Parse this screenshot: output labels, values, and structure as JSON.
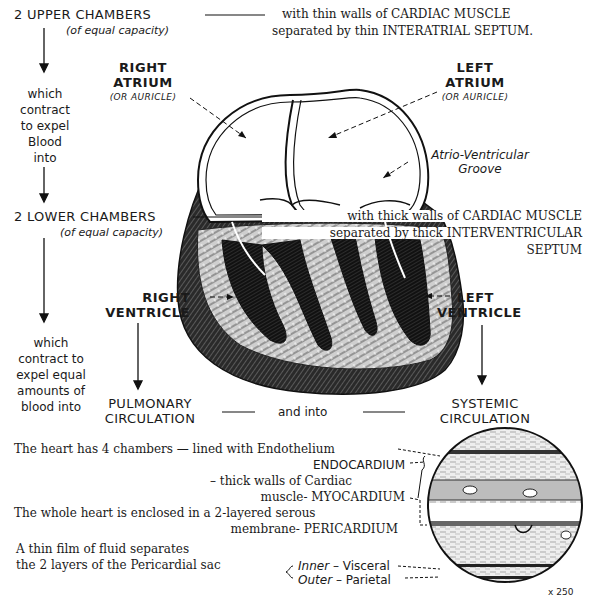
{
  "upper": {
    "title": "2 UPPER CHAMBERS",
    "subtitle": "(of equal capacity)",
    "desc_line1": "with thin walls of CARDIAC MUSCLE",
    "desc_line2": "separated by thin INTERATRIAL SEPTUM.",
    "flow_text": [
      "which",
      "contract",
      "to expel",
      "Blood",
      "into"
    ]
  },
  "atria": {
    "right": {
      "line1": "RIGHT",
      "line2": "ATRIUM",
      "alt": "(OR AURICLE)"
    },
    "left": {
      "line1": "LEFT",
      "line2": "ATRIUM",
      "alt": "(OR AURICLE)"
    },
    "groove_line1": "Atrio-Ventricular",
    "groove_line2": "Groove"
  },
  "lower": {
    "title": "2 LOWER CHAMBERS",
    "subtitle": "(of equal capacity)",
    "desc_line1": "with thick walls of CARDIAC MUSCLE",
    "desc_line2": "separated by thick INTERVENTRICULAR",
    "desc_line3": "SEPTUM",
    "flow_text": [
      "which",
      "contract to",
      "expel equal",
      "amounts of",
      "blood into"
    ]
  },
  "ventricles": {
    "right": {
      "line1": "RIGHT",
      "line2": "VENTRICLE"
    },
    "left": {
      "line1": "LEFT",
      "line2": "VENTRICLE"
    }
  },
  "circulation": {
    "pulmonary_line1": "PULMONARY",
    "pulmonary_line2": "CIRCULATION",
    "connector": "and into",
    "systemic_line1": "SYSTEMIC",
    "systemic_line2": "CIRCULATION"
  },
  "layers": {
    "line1": "The heart has 4 chambers —  lined with Endothelium",
    "line2": "ENDOCARDIUM",
    "line3": "– thick walls of Cardiac",
    "line4": "muscle-  MYOCARDIUM",
    "line5": "The whole heart is enclosed in a 2-layered serous",
    "line6": "membrane- PERICARDIUM",
    "line7": "A thin film of fluid separates",
    "line8": "the 2 layers of the Pericardial sac",
    "inner_label": "Inner",
    "inner_value": "– Visceral",
    "outer_label": "Outer",
    "outer_value": "– Parietal",
    "magnification": "x 250"
  }
}
